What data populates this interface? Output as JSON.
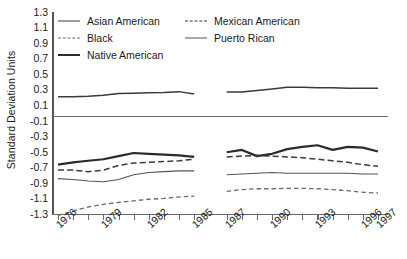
{
  "chart_data": {
    "type": "line",
    "title": "",
    "xlabel": "",
    "ylabel": "Standard Deviation Units",
    "ylim": [
      -1.3,
      1.3
    ],
    "ytick_labels": [
      "1.3",
      "1.1",
      "0.9",
      "0.7",
      "0.5",
      "0.3",
      "0.1",
      "-0.1",
      "-0.3",
      "-0.5",
      "-0.7",
      "-0.9",
      "-1.1",
      "-1.3"
    ],
    "ytick_values": [
      1.3,
      1.1,
      0.9,
      0.7,
      0.5,
      0.3,
      0.1,
      -0.1,
      -0.3,
      -0.5,
      -0.7,
      -0.9,
      -1.1,
      -1.3
    ],
    "grid": false,
    "zero_line": true,
    "legend_position": "top-left",
    "x": [
      1976,
      1977,
      1978,
      1979,
      1980,
      1981,
      1982,
      1983,
      1984,
      1985,
      1987,
      1988,
      1989,
      1990,
      1991,
      1992,
      1993,
      1994,
      1995,
      1996,
      1997
    ],
    "xtick_labels": [
      "1976",
      "1979",
      "1982",
      "1985",
      "1987",
      "1990",
      "1993",
      "1996",
      "1997"
    ],
    "xtick_label_years": [
      1976,
      1979,
      1982,
      1985,
      1987,
      1990,
      1993,
      1996,
      1997
    ],
    "gap_note": "Data break between 1985 and 1987 (no 1986 observation)",
    "series": [
      {
        "name": "Asian American",
        "style": "solid-medium",
        "values": [
          0.21,
          0.21,
          0.215,
          0.23,
          0.25,
          0.255,
          0.26,
          0.265,
          0.275,
          0.245,
          0.27,
          0.27,
          0.29,
          0.31,
          0.33,
          0.33,
          0.325,
          0.325,
          0.32,
          0.32,
          0.32
        ]
      },
      {
        "name": "Black",
        "style": "dash-fine",
        "values": [
          -1.32,
          -1.26,
          -1.21,
          -1.175,
          -1.15,
          -1.13,
          -1.11,
          -1.1,
          -1.08,
          -1.07,
          -1.01,
          -0.985,
          -0.975,
          -0.975,
          -0.97,
          -0.97,
          -0.975,
          -0.985,
          -1.0,
          -1.02,
          -1.03
        ]
      },
      {
        "name": "Native American",
        "style": "solid-thick",
        "values": [
          -0.665,
          -0.635,
          -0.615,
          -0.595,
          -0.555,
          -0.515,
          -0.525,
          -0.535,
          -0.545,
          -0.565,
          -0.505,
          -0.475,
          -0.555,
          -0.525,
          -0.465,
          -0.435,
          -0.415,
          -0.475,
          -0.435,
          -0.445,
          -0.495
        ]
      },
      {
        "name": "Mexican American",
        "style": "dash-medium",
        "values": [
          -0.735,
          -0.735,
          -0.755,
          -0.735,
          -0.675,
          -0.645,
          -0.635,
          -0.625,
          -0.615,
          -0.595,
          -0.565,
          -0.555,
          -0.545,
          -0.555,
          -0.565,
          -0.575,
          -0.595,
          -0.615,
          -0.635,
          -0.665,
          -0.685
        ]
      },
      {
        "name": "Puerto Rican",
        "style": "solid-thin",
        "values": [
          -0.845,
          -0.855,
          -0.875,
          -0.885,
          -0.855,
          -0.795,
          -0.765,
          -0.755,
          -0.745,
          -0.745,
          -0.795,
          -0.785,
          -0.775,
          -0.765,
          -0.775,
          -0.775,
          -0.775,
          -0.775,
          -0.775,
          -0.785,
          -0.785
        ]
      }
    ]
  },
  "legend": {
    "entries": [
      {
        "label": "Asian American",
        "style": "solid-medium"
      },
      {
        "label": "Mexican American",
        "style": "dash-medium"
      },
      {
        "label": "Black",
        "style": "dash-fine"
      },
      {
        "label": "Puerto Rican",
        "style": "solid-thin"
      },
      {
        "label": "Native American",
        "style": "solid-thick"
      }
    ]
  },
  "colors": {
    "asian_american": "#3a3a3a",
    "black": "#6b6b6b",
    "native_american": "#2b2b2b",
    "mexican_american": "#3a3a3a",
    "puerto_rican": "#555555",
    "axis": "#6a6a6a",
    "background": "#ffffff"
  }
}
